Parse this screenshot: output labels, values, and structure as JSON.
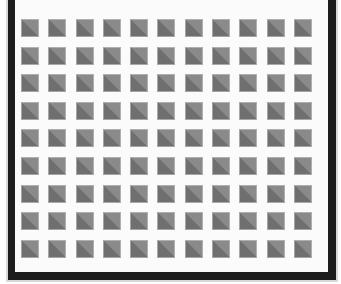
{
  "figure": {
    "kind": "tiled-square-pattern",
    "background_color": "#ffffff"
  },
  "panel": {
    "face_color": "#fbfbfb",
    "frame_color": "#1d1d1d",
    "frame_shade_color": "#d8d8d8",
    "open_side": "top",
    "framed_sides": [
      "left",
      "right",
      "bottom"
    ]
  },
  "grid": {
    "columns": 11,
    "rows": 9,
    "tile_count": 99,
    "tile_size_px": 18,
    "column_pitch_px": 27.3,
    "row_pitch_px": 27.6
  },
  "tile": {
    "light_half_color": "#8a8a8a",
    "dark_half_color": "#6f6f6f",
    "rim_color": "#c8c8c8",
    "diagonal": "top-left to bottom-right",
    "light_half_position": "upper-right",
    "dark_half_position": "lower-left"
  }
}
